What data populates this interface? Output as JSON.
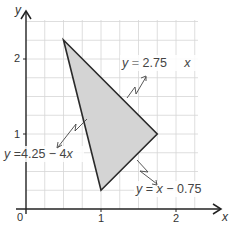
{
  "diagram": {
    "type": "coordinate-region",
    "axes": {
      "x_label": "x",
      "y_label": "y",
      "origin_label": "0",
      "x_ticks": [
        "1",
        "2"
      ],
      "y_ticks": [
        "1",
        "2"
      ],
      "grid_step": 0.25
    },
    "region": {
      "vertices": [
        [
          0.5,
          2.25
        ],
        [
          1.75,
          1
        ],
        [
          1,
          0.25
        ]
      ],
      "fill": "#d4d4d4",
      "stroke": "#2a2a2a"
    },
    "lines": [
      {
        "label_lhs": "y",
        "label_op": "=",
        "label_rhs": "2.75",
        "label_tail": "x",
        "equation": "y = 2.75 − x"
      },
      {
        "label_lhs": "y",
        "label_op": "=",
        "label_rhs": "4.25 − 4",
        "label_tail": "x",
        "equation": "y = 4.25 − 4x"
      },
      {
        "label_lhs": "y",
        "label_op": "=",
        "label_rhs_var": "x",
        "label_rhs": "− 0.75",
        "equation": "y = x − 0.75"
      }
    ]
  }
}
